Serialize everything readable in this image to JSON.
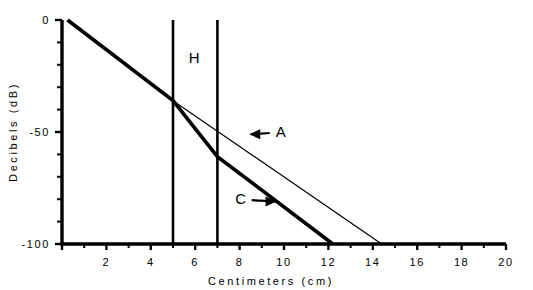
{
  "chart_data": {
    "type": "line",
    "title": "",
    "xlabel": "Centimeters (cm)",
    "ylabel": "Decibels (dB)",
    "xlim": [
      0,
      20
    ],
    "ylim": [
      -100,
      0
    ],
    "grid": false,
    "legend_position": "none",
    "x_major_ticks": [
      0,
      2,
      4,
      6,
      8,
      10,
      12,
      14,
      16,
      18,
      20
    ],
    "x_major_tick_labels": [
      "",
      "2",
      "4",
      "6",
      "8",
      "10",
      "12",
      "14",
      "16",
      "18",
      "20"
    ],
    "x_minor_ticks": [
      1,
      3,
      5,
      7,
      9,
      11,
      13,
      15,
      17,
      19
    ],
    "y_major_ticks": [
      0,
      -50,
      -100
    ],
    "y_major_tick_labels": [
      "0",
      "-50",
      "-100"
    ],
    "y_minor_ticks": [
      -10,
      -20,
      -30,
      -40,
      -60,
      -70,
      -80,
      -90
    ],
    "series": [
      {
        "name": "C",
        "style": "thick",
        "points": [
          {
            "x": 0.25,
            "y": 0
          },
          {
            "x": 5.0,
            "y": -36
          },
          {
            "x": 7.0,
            "y": -61
          },
          {
            "x": 12.2,
            "y": -100
          }
        ]
      },
      {
        "name": "A",
        "style": "thin",
        "points": [
          {
            "x": 5.0,
            "y": -36
          },
          {
            "x": 14.4,
            "y": -100
          }
        ]
      }
    ],
    "vertical_markers": [
      {
        "label": "H-left-boundary",
        "x": 5.0,
        "y_top": 0,
        "y_bottom": -100
      },
      {
        "label": "H-right-boundary",
        "x": 7.0,
        "y_top": 0,
        "y_bottom": -100
      }
    ],
    "annotations": [
      {
        "text": "H",
        "x": 5.95,
        "y": -17,
        "arrow": "none"
      },
      {
        "text": "A",
        "x": 9.85,
        "y": -50,
        "arrow": "left",
        "arrow_to_x": 8.5,
        "arrow_to_y": -51
      },
      {
        "text": "C",
        "x": 8.05,
        "y": -80,
        "arrow": "right",
        "arrow_to_x": 9.6,
        "arrow_to_y": -81
      }
    ]
  },
  "colors": {
    "ink": "#000000",
    "background": "#ffffff"
  }
}
